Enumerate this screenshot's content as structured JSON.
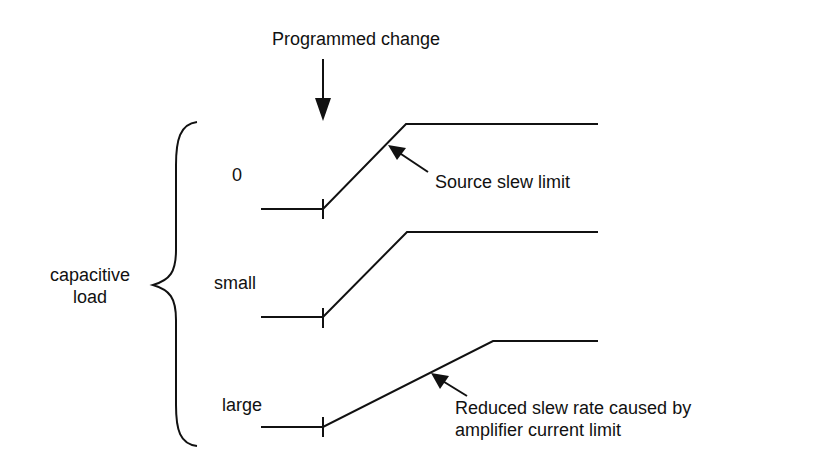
{
  "title_label": "Programmed change",
  "group_label": {
    "line1": "capacitive",
    "line2": "load"
  },
  "rows": [
    {
      "label": "0"
    },
    {
      "label": "small"
    },
    {
      "label": "large"
    }
  ],
  "annotations": {
    "source_slew": "Source slew limit",
    "reduced_slew_line1": "Reduced slew rate caused by",
    "reduced_slew_line2": "amplifier current limit"
  },
  "colors": {
    "ink": "#111111",
    "background": "#ffffff"
  }
}
